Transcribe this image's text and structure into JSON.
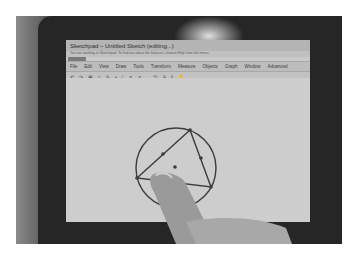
{
  "window": {
    "title": "Sketchpad – Untitled Sketch (editing...)",
    "info_text": "You are working in Sketchpad. To find out about the features, choose Help from the menu."
  },
  "menu": {
    "items": [
      {
        "label": "File"
      },
      {
        "label": "Edit"
      },
      {
        "label": "View"
      },
      {
        "label": "Draw"
      },
      {
        "label": "Tools"
      },
      {
        "label": "Transform"
      },
      {
        "label": "Measure"
      },
      {
        "label": "Objects"
      },
      {
        "label": "Graph"
      },
      {
        "label": "Window"
      },
      {
        "label": "Advanced"
      }
    ]
  },
  "toolbar": {
    "icons": [
      "undo-icon",
      "redo-icon",
      "select-icon",
      "zoom-icon",
      "pen-icon",
      "point-icon",
      "segment-icon",
      "ray-icon",
      "line-icon",
      "compass-icon",
      "fraction-icon",
      "text-icon",
      "measure-icon",
      "hand-icon"
    ],
    "glyphs": [
      "↶",
      "↷",
      "▣",
      "⌕",
      "✎",
      "•",
      "⁄",
      "↗",
      "↗",
      "◌",
      "½",
      "A",
      "ℹ",
      "✋"
    ]
  },
  "canvas": {
    "circle": {
      "cx": 110,
      "cy": 90,
      "r": 40,
      "stroke": "#3c3c3c"
    },
    "triangle": {
      "points": [
        [
          124,
          52
        ],
        [
          71,
          100
        ],
        [
          145,
          109
        ]
      ],
      "stroke": "#3c3c3c"
    },
    "midpoints": [
      [
        97,
        76
      ],
      [
        135,
        80
      ]
    ],
    "center_point": [
      109,
      89
    ]
  },
  "colors": {
    "screen": "#c9c9c9",
    "bezel": "#262626",
    "ink": "#3c3c3c"
  }
}
